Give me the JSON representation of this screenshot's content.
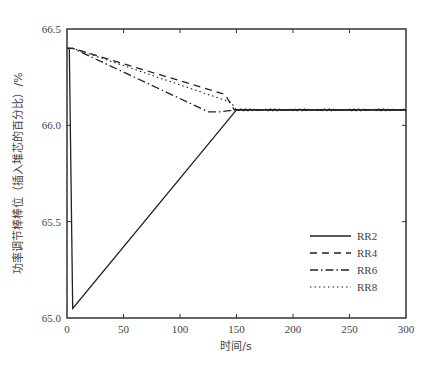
{
  "chart_data": {
    "type": "line",
    "title": "",
    "xlabel": "时间/s",
    "ylabel": "功率调节棒棒位（插入堆芯的百分比）/%",
    "xlim": [
      0,
      300
    ],
    "ylim": [
      65.0,
      66.5
    ],
    "xticks": [
      0,
      50,
      100,
      150,
      200,
      250,
      300
    ],
    "xtick_labels": [
      "0",
      "50",
      "100",
      "150",
      "200",
      "250",
      "300"
    ],
    "yticks": [
      65.0,
      65.5,
      66.0,
      66.5
    ],
    "ytick_labels": [
      "65.0",
      "65.5",
      "66.0",
      "66.5"
    ],
    "grid": false,
    "legend_position": "lower right",
    "series": [
      {
        "name": "RR2",
        "style": "solid",
        "x": [
          0,
          2,
          5,
          150,
          300
        ],
        "y": [
          66.4,
          66.4,
          65.05,
          66.08,
          66.08
        ]
      },
      {
        "name": "RR4",
        "style": "dashed",
        "x": [
          0,
          5,
          140,
          148,
          300
        ],
        "y": [
          66.4,
          66.4,
          66.16,
          66.08,
          66.08
        ]
      },
      {
        "name": "RR6",
        "style": "dashdot",
        "x": [
          0,
          5,
          125,
          135,
          148,
          300
        ],
        "y": [
          66.4,
          66.4,
          66.07,
          66.07,
          66.08,
          66.08
        ]
      },
      {
        "name": "RR8",
        "style": "dotted",
        "x": [
          0,
          5,
          145,
          150,
          300
        ],
        "y": [
          66.4,
          66.4,
          66.12,
          66.08,
          66.08
        ]
      }
    ]
  }
}
